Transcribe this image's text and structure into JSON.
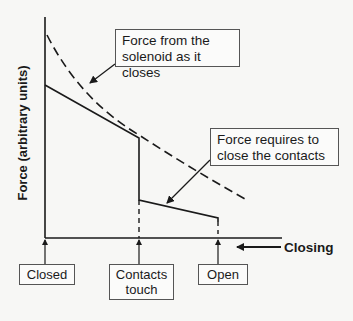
{
  "diagram": {
    "y_axis_label": "Force (arbitrary units)",
    "direction_label": "Closing",
    "callouts": {
      "solenoid": [
        "Force from the",
        "solenoid as it closes"
      ],
      "required": [
        "Force requires to",
        "close the contacts"
      ]
    },
    "positions": {
      "closed": "Closed",
      "contacts_touch": [
        "Contacts",
        "touch"
      ],
      "open": "Open"
    },
    "curves": [
      {
        "name": "Force from the solenoid as it closes",
        "style": "dashed",
        "points": [
          [
            46,
            35
          ],
          [
            139,
            133
          ],
          [
            245,
            198
          ]
        ]
      },
      {
        "name": "Force required to close the contacts",
        "style": "solid",
        "points": [
          [
            45,
            85
          ],
          [
            139,
            138
          ],
          [
            139,
            200
          ],
          [
            218,
            218
          ]
        ]
      }
    ],
    "colors": {
      "line": "#1a1a1a",
      "background": "#f7f7f5",
      "box_border": "#555555"
    }
  }
}
